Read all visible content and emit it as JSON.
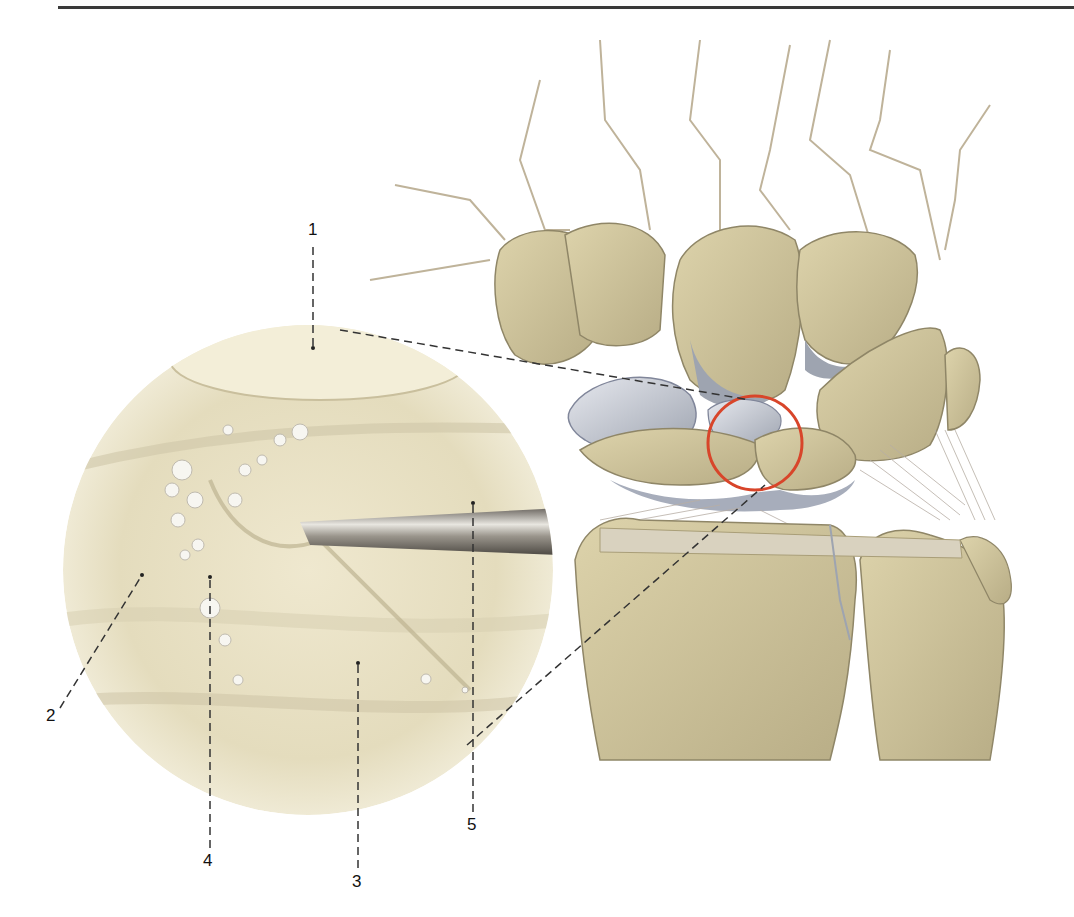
{
  "figure": {
    "callouts": [
      {
        "id": "1",
        "label": "1",
        "x": 310,
        "y": 228
      },
      {
        "id": "2",
        "label": "2",
        "x": 46,
        "y": 708
      },
      {
        "id": "3",
        "label": "3",
        "x": 355,
        "y": 885
      },
      {
        "id": "4",
        "label": "4",
        "x": 204,
        "y": 858
      },
      {
        "id": "5",
        "label": "5",
        "x": 468,
        "y": 810
      }
    ],
    "colors": {
      "bone": "#d4c9a0",
      "bone_shadow": "#a99e78",
      "cartilage": "#b7bcc6",
      "ligament": "#c9bfb4",
      "highlight_circle": "#d8452a",
      "inset_bg": "#ece5c9",
      "leader_line": "#333333"
    }
  }
}
